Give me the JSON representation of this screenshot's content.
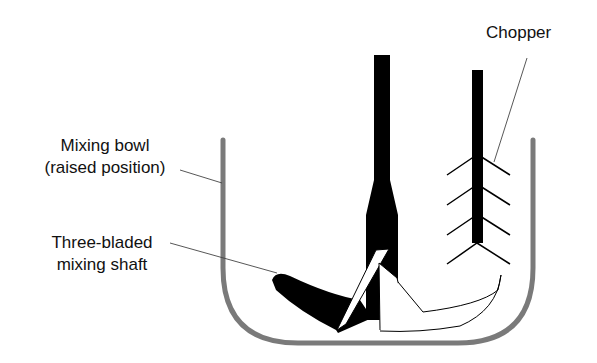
{
  "diagram": {
    "labels": {
      "chopper": "Chopper",
      "bowl_line1": "Mixing bowl",
      "bowl_line2": "(raised position)",
      "shaft_line1": "Three-bladed",
      "shaft_line2": "mixing shaft"
    },
    "colors": {
      "bowl": "#7a7a7a",
      "shaft": "#000000",
      "leader": "#333333",
      "text": "#111111"
    }
  }
}
